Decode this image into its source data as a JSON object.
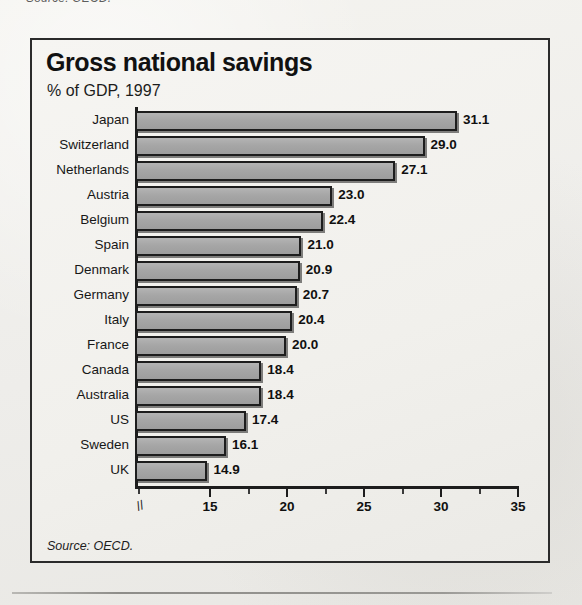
{
  "page": {
    "top_fragment": "Source: OECD.",
    "bottom_rule": "horizontal-rule"
  },
  "figure": {
    "source_note": "Source: OECD."
  },
  "chart_data": {
    "type": "bar",
    "orientation": "horizontal",
    "title": "Gross national savings",
    "subtitle": "% of GDP, 1997",
    "xlabel": "",
    "ylabel": "",
    "xlim": [
      13.5,
      35
    ],
    "axis_break": true,
    "axis_break_marker": "//",
    "grid": false,
    "legend": null,
    "xticks": [
      15,
      20,
      25,
      30,
      35
    ],
    "xtick_labels": [
      "15",
      "20",
      "25",
      "30",
      "35"
    ],
    "minor_xticks": [
      17.5,
      22.5,
      27.5,
      32.5
    ],
    "bar_color": "#a6a6a6",
    "bar_edge_color": "#1d1d1d",
    "categories": [
      "Japan",
      "Switzerland",
      "Netherlands",
      "Austria",
      "Belgium",
      "Spain",
      "Denmark",
      "Germany",
      "Italy",
      "France",
      "Canada",
      "Australia",
      "US",
      "Sweden",
      "UK"
    ],
    "values": [
      31.1,
      29.0,
      27.1,
      23.0,
      22.4,
      21.0,
      20.9,
      20.7,
      20.4,
      20.0,
      18.4,
      18.4,
      17.4,
      16.1,
      14.9
    ],
    "value_labels": [
      "31.1",
      "29.0",
      "27.1",
      "23.0",
      "22.4",
      "21.0",
      "20.9",
      "20.7",
      "20.4",
      "20.0",
      "18.4",
      "18.4",
      "17.4",
      "16.1",
      "14.9"
    ]
  }
}
